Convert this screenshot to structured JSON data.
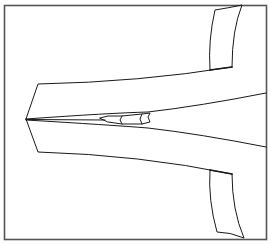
{
  "figure": {
    "caption_fragment": "Figure caption (cut off)",
    "frame_color": "#555555",
    "stroke_color": "#1a1a1a",
    "background": "#ffffff"
  }
}
